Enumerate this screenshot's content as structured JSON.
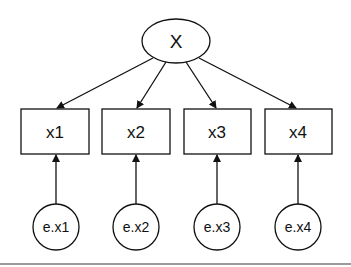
{
  "diagram": {
    "type": "confirmatory factor analysis path diagram",
    "latent": {
      "id": "X",
      "label": "X",
      "shape": "ellipse",
      "cx": 176,
      "cy": 41,
      "rx": 34,
      "ry": 22
    },
    "observed": [
      {
        "id": "x1",
        "label": "x1",
        "x": 21,
        "y": 109,
        "w": 68,
        "h": 45
      },
      {
        "id": "x2",
        "label": "x2",
        "x": 102,
        "y": 109,
        "w": 68,
        "h": 45
      },
      {
        "id": "x3",
        "label": "x3",
        "x": 184,
        "y": 109,
        "w": 67,
        "h": 45
      },
      {
        "id": "x4",
        "label": "x4",
        "x": 265,
        "y": 109,
        "w": 67,
        "h": 45
      }
    ],
    "errors": [
      {
        "id": "e.x1",
        "label": "e.x1",
        "cx": 56,
        "cy": 227,
        "r": 23
      },
      {
        "id": "e.x2",
        "label": "e.x2",
        "cx": 136,
        "cy": 227,
        "r": 23
      },
      {
        "id": "e.x3",
        "label": "e.x3",
        "cx": 217,
        "cy": 227,
        "r": 23
      },
      {
        "id": "e.x4",
        "label": "e.x4",
        "cx": 298,
        "cy": 227,
        "r": 23
      }
    ],
    "edges": [
      {
        "from": "X",
        "to": "x1"
      },
      {
        "from": "X",
        "to": "x2"
      },
      {
        "from": "X",
        "to": "x3"
      },
      {
        "from": "X",
        "to": "x4"
      },
      {
        "from": "e.x1",
        "to": "x1"
      },
      {
        "from": "e.x2",
        "to": "x2"
      },
      {
        "from": "e.x3",
        "to": "x3"
      },
      {
        "from": "e.x4",
        "to": "x4"
      }
    ],
    "colors": {
      "stroke": "#111111",
      "background": "#ffffff",
      "rule": "#9a9a9a"
    }
  }
}
